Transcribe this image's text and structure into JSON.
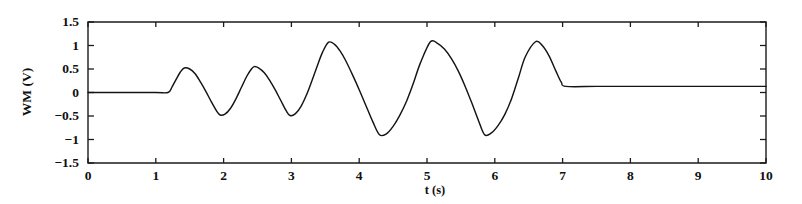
{
  "chart_data": {
    "type": "line",
    "title": "",
    "xlabel": "t (s)",
    "ylabel": "WM (V)",
    "xlim": [
      0,
      10
    ],
    "ylim": [
      -1.5,
      1.5
    ],
    "grid": false,
    "legend": null,
    "x_ticks": [
      0,
      1,
      2,
      3,
      4,
      5,
      6,
      7,
      8,
      9,
      10
    ],
    "x_tick_labels": [
      "0",
      "1",
      "2",
      "3",
      "4",
      "5",
      "6",
      "7",
      "8",
      "9",
      "10"
    ],
    "y_ticks": [
      -1.5,
      -1,
      -0.5,
      0,
      0.5,
      1,
      1.5
    ],
    "y_tick_labels": [
      "−1.5",
      "−1",
      "−0.5",
      "0",
      "0.5",
      "1",
      "1.5"
    ],
    "series": [
      {
        "name": "WM",
        "color": "#141414",
        "x": [
          0.0,
          0.5,
          1.0,
          1.18,
          1.24,
          1.3,
          1.36,
          1.42,
          1.5,
          1.58,
          1.66,
          1.74,
          1.82,
          1.9,
          1.95,
          2.02,
          2.1,
          2.18,
          2.26,
          2.34,
          2.4,
          2.45,
          2.52,
          2.6,
          2.68,
          2.76,
          2.84,
          2.92,
          2.98,
          3.06,
          3.14,
          3.22,
          3.3,
          3.38,
          3.46,
          3.55,
          3.64,
          3.72,
          3.8,
          3.9,
          4.0,
          4.1,
          4.2,
          4.3,
          4.4,
          4.5,
          4.6,
          4.7,
          4.8,
          4.9,
          5.05,
          5.16,
          5.26,
          5.36,
          5.46,
          5.56,
          5.66,
          5.76,
          5.85,
          5.95,
          6.05,
          6.15,
          6.25,
          6.35,
          6.45,
          6.6,
          6.7,
          6.8,
          6.9,
          6.98,
          7.05,
          7.5,
          8.0,
          8.5,
          9.0,
          9.5,
          10.0
        ],
        "y": [
          0.0,
          0.0,
          0.0,
          0.0,
          0.12,
          0.28,
          0.43,
          0.52,
          0.5,
          0.4,
          0.22,
          0.02,
          -0.2,
          -0.4,
          -0.48,
          -0.46,
          -0.34,
          -0.14,
          0.1,
          0.34,
          0.48,
          0.55,
          0.52,
          0.42,
          0.26,
          0.06,
          -0.16,
          -0.38,
          -0.49,
          -0.45,
          -0.3,
          -0.06,
          0.24,
          0.56,
          0.86,
          1.07,
          1.02,
          0.88,
          0.68,
          0.38,
          0.06,
          -0.28,
          -0.62,
          -0.9,
          -0.88,
          -0.72,
          -0.48,
          -0.18,
          0.2,
          0.62,
          1.08,
          1.04,
          0.92,
          0.72,
          0.46,
          0.14,
          -0.22,
          -0.6,
          -0.9,
          -0.86,
          -0.7,
          -0.46,
          -0.12,
          0.32,
          0.76,
          1.08,
          1.0,
          0.78,
          0.46,
          0.22,
          0.13,
          0.13,
          0.13,
          0.13,
          0.13,
          0.13,
          0.13
        ]
      }
    ],
    "annotations": [
      {
        "text": "signal is zero before t ≈ 1.2 s, grows in oscillation, then settles to a small constant after t ≈ 7 s"
      }
    ]
  },
  "axis": {
    "x_title": "t (s)",
    "y_title": "WM (V)"
  }
}
